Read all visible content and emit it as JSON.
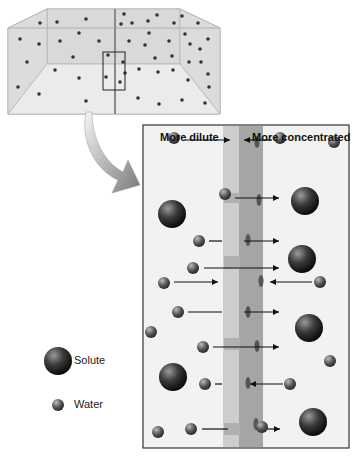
{
  "labels": {
    "left": "More dilute",
    "right": "More concentrated"
  },
  "legend": {
    "solute": "Solute",
    "water": "Water"
  },
  "colors": {
    "panel_bg": "#f2f2f2",
    "membrane": "#b8b8b8",
    "membrane_dark": "#9a9a9a",
    "particle": "#2b2b2b",
    "arrow": "#111111"
  },
  "tank": {
    "dots": [
      [
        40,
        23
      ],
      [
        57,
        22
      ],
      [
        86,
        19
      ],
      [
        124,
        14
      ],
      [
        121,
        24
      ],
      [
        132,
        23
      ],
      [
        148,
        21
      ],
      [
        157,
        15
      ],
      [
        174,
        23
      ],
      [
        182,
        16
      ],
      [
        198,
        23
      ],
      [
        20,
        39
      ],
      [
        39,
        44
      ],
      [
        60,
        41
      ],
      [
        79,
        33
      ],
      [
        99,
        41
      ],
      [
        129,
        41
      ],
      [
        145,
        45
      ],
      [
        149,
        33
      ],
      [
        169,
        41
      ],
      [
        185,
        34
      ],
      [
        190,
        44
      ],
      [
        200,
        49
      ],
      [
        208,
        39
      ],
      [
        27,
        62
      ],
      [
        73,
        57
      ],
      [
        108,
        55
      ],
      [
        123,
        62
      ],
      [
        155,
        58
      ],
      [
        172,
        56
      ],
      [
        189,
        62
      ],
      [
        201,
        62
      ],
      [
        55,
        70
      ],
      [
        79,
        78
      ],
      [
        106,
        77
      ],
      [
        125,
        73
      ],
      [
        139,
        69
      ],
      [
        158,
        72
      ],
      [
        173,
        70
      ],
      [
        188,
        80
      ],
      [
        208,
        74
      ],
      [
        18,
        87
      ],
      [
        39,
        94
      ],
      [
        86,
        101
      ],
      [
        138,
        98
      ],
      [
        159,
        104
      ],
      [
        182,
        100
      ],
      [
        205,
        103
      ],
      [
        209,
        87
      ],
      [
        120,
        82
      ]
    ]
  },
  "panel": {
    "water": [
      [
        174,
        138
      ],
      [
        280,
        138
      ],
      [
        334,
        142
      ],
      [
        225,
        194
      ],
      [
        199,
        241
      ],
      [
        193,
        268
      ],
      [
        164,
        283
      ],
      [
        320,
        282
      ],
      [
        178,
        312
      ],
      [
        151,
        332
      ],
      [
        203,
        347
      ],
      [
        330,
        361
      ],
      [
        205,
        384
      ],
      [
        290,
        384
      ],
      [
        158,
        432
      ],
      [
        191,
        429
      ],
      [
        262,
        427
      ]
    ],
    "solute": [
      [
        172,
        214
      ],
      [
        305,
        201
      ],
      [
        302,
        259
      ],
      [
        309,
        328
      ],
      [
        173,
        377
      ],
      [
        313,
        422
      ]
    ],
    "arrows": [
      {
        "x1": 185,
        "x2": 230,
        "y": 140,
        "dir": "right"
      },
      {
        "x1": 244,
        "x2": 272,
        "y": 140,
        "dir": "left"
      },
      {
        "x1": 235,
        "x2": 279,
        "y": 198,
        "dir": "right"
      },
      {
        "x1": 209,
        "x2": 222,
        "y": 241,
        "dir": "line"
      },
      {
        "x1": 244,
        "x2": 279,
        "y": 241,
        "dir": "right"
      },
      {
        "x1": 204,
        "x2": 279,
        "y": 268,
        "dir": "right"
      },
      {
        "x1": 174,
        "x2": 218,
        "y": 282,
        "dir": "right"
      },
      {
        "x1": 270,
        "x2": 312,
        "y": 282,
        "dir": "left"
      },
      {
        "x1": 188,
        "x2": 222,
        "y": 312,
        "dir": "line"
      },
      {
        "x1": 244,
        "x2": 279,
        "y": 312,
        "dir": "right"
      },
      {
        "x1": 213,
        "x2": 279,
        "y": 347,
        "dir": "right"
      },
      {
        "x1": 215,
        "x2": 222,
        "y": 384,
        "dir": "line"
      },
      {
        "x1": 250,
        "x2": 283,
        "y": 384,
        "dir": "left"
      },
      {
        "x1": 202,
        "x2": 228,
        "y": 429,
        "dir": "line"
      },
      {
        "x1": 256,
        "x2": 280,
        "y": 429,
        "dir": "right"
      }
    ]
  }
}
